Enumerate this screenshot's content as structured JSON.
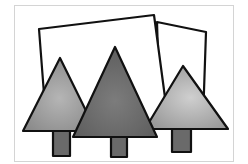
{
  "illustration": {
    "subject": "three triangular trees in front of two tilted rectangles",
    "colors": {
      "background": "#ffffff",
      "frame_border": "#d4d4d4",
      "outline": "#111111",
      "rectangle_fill": "#ffffff",
      "tree_left": "#8a8a8a",
      "tree_left_highlight": "#b5b5b5",
      "tree_middle": "#5e5e5e",
      "tree_middle_highlight": "#7c7c7c",
      "tree_right": "#9a9a9a",
      "tree_right_highlight": "#cfcfcf",
      "trunk": "#6a6a6a"
    },
    "trees": [
      {
        "name": "left"
      },
      {
        "name": "middle"
      },
      {
        "name": "right"
      }
    ],
    "rectangles": [
      {
        "name": "back-left"
      },
      {
        "name": "back-right"
      }
    ]
  }
}
